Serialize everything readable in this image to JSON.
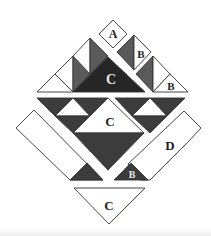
{
  "figure": {
    "colors": {
      "white": "#ffffff",
      "outline": "#333333",
      "medium_gray": "#5a5a5a",
      "dark_gray": "#3c3c3c",
      "darkest": "#262626",
      "label_light": "#e8e8e8",
      "label_dark": "#222222"
    },
    "labels": {
      "top_square": "A",
      "upper_right_strip": "B",
      "right_triangle": "B",
      "top_dark_triangle": "C",
      "middle_triangle": "C",
      "right_bar": "D",
      "bottom_small_triangle": "B",
      "bottom_triangle": "C"
    }
  }
}
